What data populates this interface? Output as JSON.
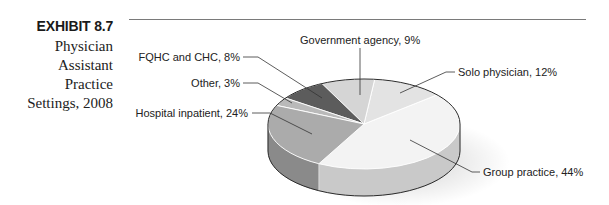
{
  "caption": {
    "exhibit": "EXHIBIT 8.7",
    "title_lines": [
      "Physician",
      "Assistant",
      "Practice",
      "Settings, 2008"
    ]
  },
  "chart_data": {
    "type": "pie",
    "style": "3d",
    "title": "Physician Assistant Practice Settings, 2008",
    "categories": [
      "Group practice",
      "Solo physician",
      "Government agency",
      "FQHC and CHC",
      "Other",
      "Hospital inpatient"
    ],
    "values": [
      44,
      12,
      9,
      8,
      3,
      24
    ],
    "unit": "%",
    "labels": [
      "Group practice, 44%",
      "Solo physician, 12%",
      "Government agency, 9%",
      "FQHC and CHC, 8%",
      "Other, 3%",
      "Hospital inpatient, 24%"
    ],
    "colors": {
      "top": [
        "#f3f3f3",
        "#e3e3e3",
        "#d5d5d5",
        "#5c5c5c",
        "#b9b9b9",
        "#ababab"
      ],
      "side": [
        "#c9c9c9",
        "#bdbdbd",
        "#b0b0b0",
        "#4a4a4a",
        "#8f8f8f",
        "#8a8a8a"
      ]
    },
    "legend": "none (leader-line labels)"
  }
}
